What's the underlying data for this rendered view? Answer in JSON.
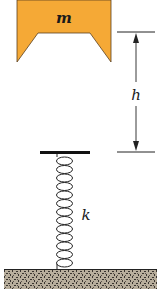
{
  "diagram": {
    "mass": {
      "label": "m",
      "color": "#f5a936",
      "outline": "#5a4020"
    },
    "height_dimension": {
      "label": "h",
      "line_color": "#222222"
    },
    "spring": {
      "label": "k",
      "coil_count": 13,
      "color": "#222222"
    },
    "platform": {
      "color": "#111111"
    },
    "ground": {
      "fill": "#b8ae9c",
      "speck": "#3a3530",
      "top_line": "#222222"
    }
  }
}
